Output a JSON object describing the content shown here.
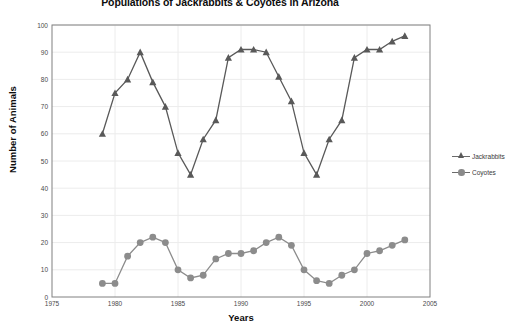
{
  "chart_data": {
    "type": "line",
    "title": "Populations of Jackrabbits & Coyotes in Arizona",
    "xlabel": "Years",
    "ylabel": "Number of Animals",
    "xlim": [
      1975,
      2005
    ],
    "ylim": [
      0,
      100
    ],
    "xticks": [
      1975,
      1980,
      1985,
      1990,
      1995,
      2000,
      2005
    ],
    "yticks": [
      0,
      10,
      20,
      30,
      40,
      50,
      60,
      70,
      80,
      90,
      100
    ],
    "grid": true,
    "legend_position": "right",
    "x": [
      1979,
      1980,
      1981,
      1982,
      1983,
      1984,
      1985,
      1986,
      1987,
      1988,
      1989,
      1990,
      1991,
      1992,
      1993,
      1994,
      1995,
      1996,
      1997,
      1998,
      1999,
      2000,
      2001,
      2002,
      2003
    ],
    "series": [
      {
        "name": "Jackrabbits",
        "marker": "triangle",
        "color": "#595959",
        "values": [
          60,
          75,
          80,
          90,
          79,
          70,
          53,
          45,
          58,
          65,
          88,
          91,
          91,
          90,
          81,
          72,
          53,
          45,
          58,
          65,
          88,
          91,
          91,
          94,
          96
        ]
      },
      {
        "name": "Coyotes",
        "marker": "circle",
        "color": "#8c8c8c",
        "values": [
          5,
          5,
          15,
          20,
          22,
          20,
          10,
          7,
          8,
          14,
          16,
          16,
          17,
          20,
          22,
          19,
          10,
          6,
          5,
          8,
          10,
          16,
          17,
          19,
          21
        ]
      }
    ]
  },
  "legend": {
    "items": [
      {
        "label": "Jackrabbits"
      },
      {
        "label": "Coyotes"
      }
    ]
  }
}
